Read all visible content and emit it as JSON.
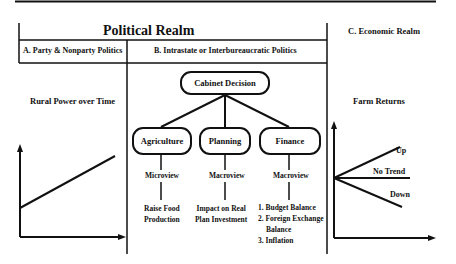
{
  "header": {
    "political_realm": "Political Realm",
    "section_a": "A. Party & Nonparty Politics",
    "section_b": "B. Intrastate or Interbureaucratic Politics",
    "section_c": "C. Economic Realm"
  },
  "left_chart": {
    "title": "Rural Power over Time"
  },
  "tree": {
    "root": "Cabinet Decision",
    "children": [
      {
        "label": "Agriculture",
        "view": "Microview",
        "outcome_lines": [
          "Raise Food",
          "Production"
        ]
      },
      {
        "label": "Planning",
        "view": "Macroview",
        "outcome_lines": [
          "Impact on Real",
          "Plan Investment"
        ]
      },
      {
        "label": "Finance",
        "view": "Macroview",
        "outcome_lines": [
          "1. Budget Balance",
          "2. Foreign Exchange",
          "Balance",
          "3. Inflation"
        ]
      }
    ]
  },
  "right_chart": {
    "title": "Farm Returns",
    "labels": {
      "up": "Up",
      "no_trend": "No Trend",
      "down": "Down"
    }
  }
}
